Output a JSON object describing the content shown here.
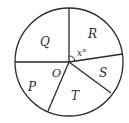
{
  "diagram": {
    "type": "circle-graph",
    "center_label": "O",
    "angle_label": "x°",
    "sectors": [
      {
        "label": "Q"
      },
      {
        "label": "R"
      },
      {
        "label": "S"
      },
      {
        "label": "T"
      },
      {
        "label": "P"
      }
    ],
    "colors": {
      "stroke": "#2a2a2a",
      "background": "#ffffff"
    }
  }
}
